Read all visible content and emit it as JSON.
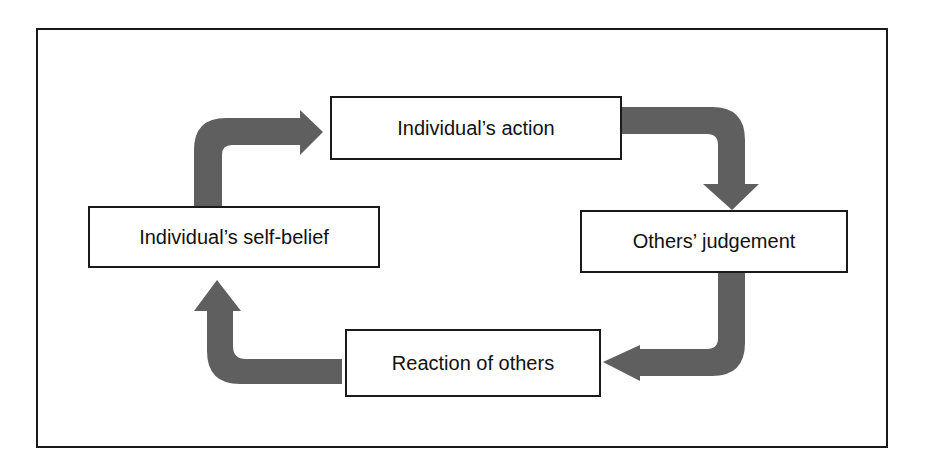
{
  "diagram": {
    "type": "cycle",
    "colors": {
      "arrow": "#5f5f5f",
      "border": "#1a1a1a",
      "text": "#111111",
      "background": "#ffffff"
    },
    "nodes": [
      {
        "id": "action",
        "label": "Individual’s action"
      },
      {
        "id": "judgement",
        "label": "Others’ judgement"
      },
      {
        "id": "reaction",
        "label": "Reaction of others"
      },
      {
        "id": "self_belief",
        "label": "Individual’s self-belief"
      }
    ],
    "edges": [
      {
        "from": "self_belief",
        "to": "action"
      },
      {
        "from": "action",
        "to": "judgement"
      },
      {
        "from": "judgement",
        "to": "reaction"
      },
      {
        "from": "reaction",
        "to": "self_belief"
      }
    ]
  }
}
